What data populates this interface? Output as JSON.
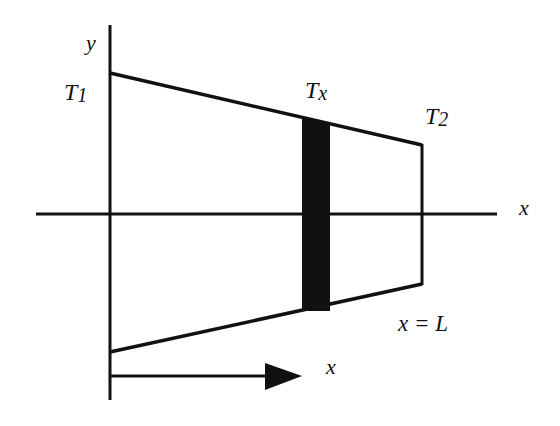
{
  "diagram": {
    "type": "tapered-rod-heat-conduction",
    "labels": {
      "y_axis": "y",
      "x_axis": "x",
      "t1": "T",
      "t1_sub": "1",
      "tx": "T",
      "tx_sub": "x",
      "t2": "T",
      "t2_sub": "2",
      "x_eq_L": "x = L",
      "arrow_x": "x"
    },
    "colors": {
      "stroke": "#111111",
      "slab_fill": "#111111",
      "background": "#ffffff"
    }
  }
}
